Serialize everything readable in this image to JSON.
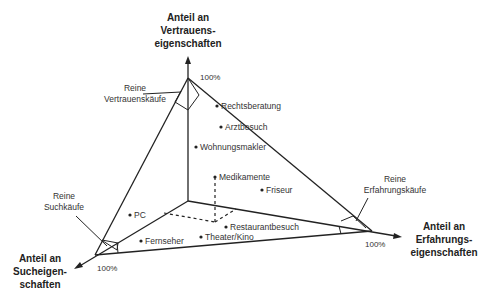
{
  "axes": {
    "top": {
      "label_lines": [
        "Anteil an",
        "Vertrauens-",
        "eigenschaften"
      ],
      "pct": "100%"
    },
    "left": {
      "label_lines": [
        "Anteil an",
        "Sucheigen-",
        "schaften"
      ],
      "pct": "100%"
    },
    "right": {
      "label_lines": [
        "Anteil an",
        "Erfahrungs-",
        "eigenschaften"
      ],
      "pct": "100%"
    }
  },
  "corners": {
    "top": {
      "label_lines": [
        "Reine",
        "Vertrauenskäufe"
      ]
    },
    "left": {
      "label_lines": [
        "Reine",
        "Suchkäufe"
      ]
    },
    "right": {
      "label_lines": [
        "Reine",
        "Erfahrungskäufe"
      ]
    }
  },
  "points": [
    {
      "label": "Rechtsberatung",
      "x": 217,
      "y": 106
    },
    {
      "label": "Arztbesuch",
      "x": 221,
      "y": 127
    },
    {
      "label": "Wohnungsmakler",
      "x": 196,
      "y": 147
    },
    {
      "label": "Medikamente",
      "x": 215,
      "y": 177
    },
    {
      "label": "Friseur",
      "x": 262,
      "y": 190
    },
    {
      "label": "PC",
      "x": 130,
      "y": 215
    },
    {
      "label": "Restaurantbesuch",
      "x": 226,
      "y": 227
    },
    {
      "label": "Fernseher",
      "x": 141,
      "y": 241
    },
    {
      "label": "Theater/Kino",
      "x": 201,
      "y": 237
    }
  ],
  "colors": {
    "line": "#222222",
    "text": "#333333",
    "background": "#ffffff"
  }
}
